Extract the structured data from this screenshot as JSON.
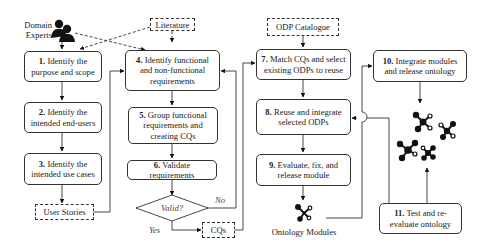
{
  "actors": {
    "domain_experts": {
      "line1": "Domain",
      "line2": "Experts"
    }
  },
  "sources": {
    "literature": "Literature",
    "odp_catalogue": "ODP Catalogue",
    "user_stories": "User Stories",
    "cqs": "CQs"
  },
  "steps": [
    {
      "num": "1.",
      "text": "Identify the purpose and scope"
    },
    {
      "num": "2.",
      "text": "Identify the intended end-users"
    },
    {
      "num": "3.",
      "text": "Identify the intended use cases"
    },
    {
      "num": "4.",
      "text": "Identify functional and non-functional requirements"
    },
    {
      "num": "5.",
      "text": "Group functional requirements and creating CQs"
    },
    {
      "num": "6.",
      "text": "Validate requirements"
    },
    {
      "num": "7.",
      "text": "Match CQs and select existing ODPs to reuse"
    },
    {
      "num": "8.",
      "text": "Reuse and integrate selected ODPs"
    },
    {
      "num": "9.",
      "text": "Evaluate, fix, and release module"
    },
    {
      "num": "10.",
      "text": "Integrate modules and release ontology"
    },
    {
      "num": "11.",
      "text": "Test and re-evaluate ontology"
    }
  ],
  "decision": {
    "label": "Valid?",
    "no": "No",
    "yes": "Yes"
  },
  "outputs": {
    "ontology_modules": "Ontology Modules"
  }
}
